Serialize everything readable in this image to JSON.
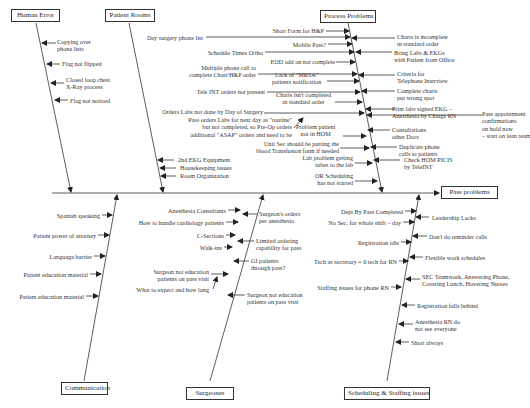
{
  "effect": "Pass problems",
  "categories": {
    "human_error": {
      "title": "Human Error",
      "causes": [
        "Copying over\nphone lists",
        "Flag not flipped",
        "Closed loop chest\nX-Ray process",
        "Flag not noticed"
      ]
    },
    "patient_rooms": {
      "title": "Patient Rooms",
      "causes": [
        "2nd EKG Equipment",
        "Housekeeping issues",
        "Room Organization"
      ]
    },
    "process_problems": {
      "title": "Process Problems",
      "left_causes": [
        "Short Form for H&P",
        "Day surgery phone list",
        "Mobile Pass?",
        "Schedule Times Ortho",
        "EOD add on not complete",
        "Multiple phone call to\ncomplete Chart/H&P order",
        "Lack of \"MRSA\"\npatients notification",
        "Tele INT orders not present",
        "Charts isn't completed\nin standard order",
        "Orders Labs not done by Day of Surgery",
        "Pass orders Labs for next day as \"routine\"\nbut not completed, so Pre-Op orders\nadditional \"ASAP\" orders and need to be",
        "Problem patient\nnot in HOM",
        "Unit Sec should be putting the\nblood Transfusion form if needed",
        "Lab problem getting\ntubes to the lab",
        "OR Scheduling\nhas not started"
      ],
      "right_causes": [
        "Charts is incomplete\nin standard order",
        "Bring Labs & EKGs\nwith Patient from Office",
        "Criteria for\nTelephone Interview",
        "Complete charts\nput wrong spot",
        "Print labs signed EKG –\nAnesthesia by Charge RN",
        "Pass appointment\nconfirmations\non hold now\n– start on lean team",
        "Consultations\nother Docs",
        "Duplicate phone\ncalls to patients",
        "Check HOM PICIS\nby TeleINT"
      ]
    },
    "communication": {
      "title": "Communication",
      "causes": [
        "Spanish speaking",
        "Patient power of attorney",
        "Language barrier",
        "Patient education material",
        "Patient education material"
      ]
    },
    "surgeones": {
      "title": "Surgeones",
      "left_causes": [
        "Anesthesia Consultants",
        "How to handle cardiology patients",
        "C-Sections",
        "Walk-ins",
        "Surgeon not education\npatients on pass visit",
        "What to expect and how long"
      ],
      "right_causes": [
        "Surgeon's orders\nper anesthesia",
        "Limited ordering\ncapability for pass",
        "GI patients\nthrough pass?",
        "Surgeon not education\npatients on pass visit"
      ]
    },
    "scheduling": {
      "title": "Scheduling & Staffing issues",
      "left_causes": [
        "Dept By Pass Completed",
        "No Sec. for whole shift – day",
        "Registration idle",
        "Tech as secretary = 0 tech for RN",
        "Staffing issues for phone RN"
      ],
      "right_causes": [
        "Leadership Lacks",
        "Don't do reminder calls",
        "Flexible work schedules",
        "SEC Teamwork, Answering Phone,\nCovering Lunch, Hovering Nurses",
        "Registration falls behind",
        "Anesthesia RN do\nnot see everyone",
        "Short always"
      ]
    }
  }
}
